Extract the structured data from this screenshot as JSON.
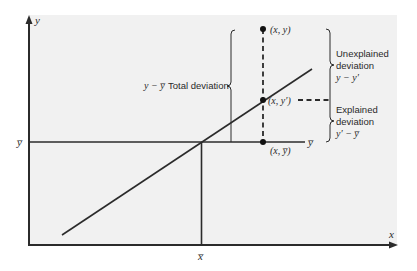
{
  "diagram": {
    "type": "regression-deviation-diagram",
    "background_color": "#f1f1f1",
    "line_color": "#2b2b2b",
    "axes": {
      "x_label": "x",
      "y_label": "y",
      "x_mean_label": "x̅",
      "y_mean_label_left": "y̅",
      "y_mean_label_right": "y̅"
    },
    "points": {
      "observed": "(x, y)",
      "predicted": "(x, y′)",
      "mean": "(x, y̅)"
    },
    "total_deviation": {
      "formula": "y − y̅",
      "label": "Total deviation"
    },
    "unexplained_deviation": {
      "line1": "Unexplained",
      "line2": "deviation",
      "formula": "y − y′"
    },
    "explained_deviation": {
      "line1": "Explained",
      "line2": "deviation",
      "formula": "y′ − y̅"
    }
  }
}
